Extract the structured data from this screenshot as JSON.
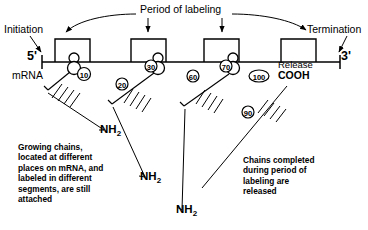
{
  "diagram": {
    "title_label": "Period of labeling",
    "left_annotation": "Initiation",
    "right_annotation": "Termination",
    "mrna_label": "mRNA",
    "five_prime": "5'",
    "three_prime": "3'",
    "release_label": "Release",
    "cooh_label": "COOH",
    "amino_terminus_label": "NH",
    "amino_terminus_subscript": "2",
    "captions": {
      "attached": "Growing chains,\nlocated at different\nplaces on mRNA, and\nlabeled in different\nsegments, are still\nattached",
      "released": "Chains completed\nduring period of\nlabeling are\nreleased"
    },
    "ribosomes": [
      {
        "name": "ribosome-1",
        "x": 74,
        "residue_number": "10",
        "chain_end_label": "NH2"
      },
      {
        "name": "ribosome-2",
        "x": 158,
        "residue_number": "30",
        "chain_end_label": "NH2"
      },
      {
        "name": "ribosome-3",
        "x": 233,
        "residue_number": "70",
        "chain_end_label": "NH2"
      }
    ],
    "chain_markers": [
      {
        "name": "marker-10",
        "value": "10",
        "x": 84,
        "y": 74,
        "shape": "circle"
      },
      {
        "name": "marker-20",
        "value": "20",
        "x": 122,
        "y": 84,
        "shape": "circle"
      },
      {
        "name": "marker-30",
        "value": "30",
        "x": 151,
        "y": 66,
        "shape": "circle"
      },
      {
        "name": "marker-60",
        "value": "60",
        "x": 193,
        "y": 76,
        "shape": "circle"
      },
      {
        "name": "marker-70",
        "value": "70",
        "x": 226,
        "y": 66,
        "shape": "circle"
      },
      {
        "name": "marker-100",
        "value": "100",
        "x": 259,
        "y": 76,
        "shape": "oval"
      },
      {
        "name": "marker-90",
        "value": "90",
        "x": 248,
        "y": 112,
        "shape": "circle"
      }
    ],
    "bracket_count": 4,
    "colors": {
      "stroke": "#000000",
      "background": "#ffffff"
    }
  }
}
